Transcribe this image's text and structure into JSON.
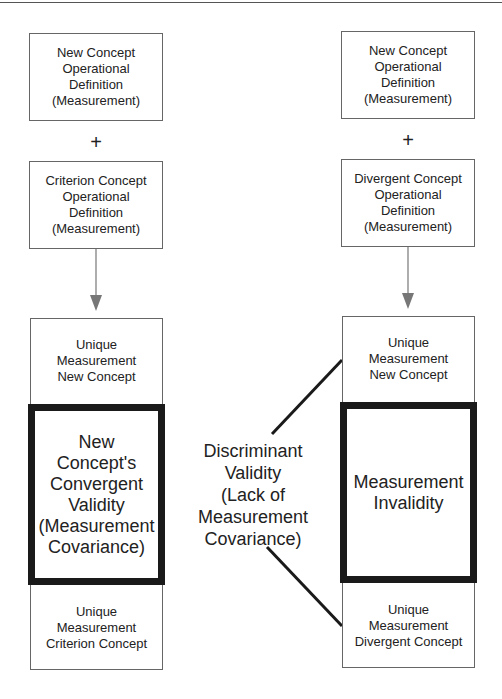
{
  "left_column": {
    "box1": "New Concept\nOperational\nDefinition\n(Measurement)",
    "plus": "+",
    "box2": "Criterion Concept\nOperational\nDefinition\n(Measurement)",
    "unique_top": "Unique\nMeasurement\nNew Concept",
    "validity": "New\nConcept's\nConvergent\nValidity\n(Measurement\nCovariance)",
    "unique_bottom": "Unique\nMeasurement\nCriterion Concept"
  },
  "right_column": {
    "box1": "New Concept\nOperational\nDefinition\n(Measurement)",
    "plus": "+",
    "box2": "Divergent Concept\nOperational\nDefinition\n(Measurement)",
    "unique_top": "Unique\nMeasurement\nNew Concept",
    "invalidity": "Measurement\nInvalidity",
    "unique_bottom": "Unique\nMeasurement\nDivergent Concept"
  },
  "center_label": "Discriminant\nValidity\n(Lack of\nMeasurement\nCovariance)",
  "colors": {
    "thick_border": "#1a1a1a",
    "thin_border": "#666666",
    "arrow": "#666666"
  }
}
